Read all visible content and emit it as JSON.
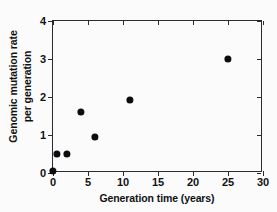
{
  "chart_data": {
    "type": "scatter",
    "title": "",
    "xlabel": "Generation time (years)",
    "ylabel_line1": "Genomic mutation rate",
    "ylabel_line2": "per generation",
    "xlim": [
      0,
      30
    ],
    "ylim": [
      0,
      4
    ],
    "xticks": [
      0,
      5,
      10,
      15,
      20,
      25,
      30
    ],
    "yticks": [
      0,
      1,
      2,
      3,
      4
    ],
    "xticklabels": [
      "0",
      "5",
      "10",
      "15",
      "20",
      "25",
      "30"
    ],
    "yticklabels": [
      "0",
      "1",
      "2",
      "3",
      "4"
    ],
    "grid": false,
    "legend": null,
    "marker": "filled-circle",
    "marker_color": "#0c0c10",
    "axis_color": "#2a2b31",
    "background_color": "#fbfbfb",
    "points": [
      {
        "x": 0.0,
        "y": 0.05
      },
      {
        "x": 0.5,
        "y": 0.5
      },
      {
        "x": 2.0,
        "y": 0.5
      },
      {
        "x": 4.0,
        "y": 1.6
      },
      {
        "x": 6.0,
        "y": 0.95
      },
      {
        "x": 11.0,
        "y": 1.93
      },
      {
        "x": 25.0,
        "y": 3.0
      }
    ]
  }
}
